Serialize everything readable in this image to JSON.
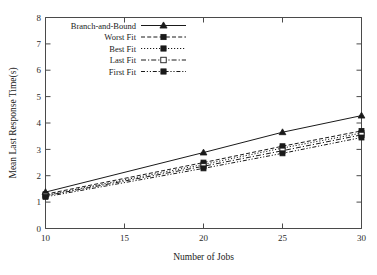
{
  "chart_data": {
    "type": "line",
    "title": "",
    "xlabel": "Number of Jobs",
    "ylabel": "Mean Last Response Time(s)",
    "x": [
      10,
      20,
      25,
      30
    ],
    "xlim": [
      10,
      30
    ],
    "ylim": [
      0,
      8
    ],
    "xticks": [
      "10",
      "15",
      "20",
      "25",
      "30"
    ],
    "xtick_values": [
      10,
      15,
      20,
      25,
      30
    ],
    "yticks": [
      "0",
      "1",
      "2",
      "3",
      "4",
      "5",
      "6",
      "7",
      "8"
    ],
    "ytick_values": [
      0,
      1,
      2,
      3,
      4,
      5,
      6,
      7,
      8
    ],
    "grid": false,
    "legend_position": "top-left-inside",
    "series": [
      {
        "name": "Branch-and-Bound",
        "values": [
          1.38,
          2.88,
          3.65,
          4.28
        ],
        "dash": "none",
        "marker": "filled-triangle"
      },
      {
        "name": "Worst Fit",
        "values": [
          1.3,
          2.5,
          3.12,
          3.7
        ],
        "dash": "dashed",
        "marker": "filled-square"
      },
      {
        "name": "Best Fit",
        "values": [
          1.26,
          2.43,
          3.05,
          3.62
        ],
        "dash": "dotted",
        "marker": "filled-square"
      },
      {
        "name": "Last Fit",
        "values": [
          1.24,
          2.36,
          2.95,
          3.55
        ],
        "dash": "dashdot",
        "marker": "open-square"
      },
      {
        "name": "First Fit",
        "values": [
          1.2,
          2.28,
          2.85,
          3.45
        ],
        "dash": "dashdotdot",
        "marker": "filled-square"
      }
    ]
  },
  "legend": {
    "entries": [
      {
        "label": "Branch-and-Bound"
      },
      {
        "label": "Worst Fit"
      },
      {
        "label": "Best Fit"
      },
      {
        "label": "Last Fit"
      },
      {
        "label": "First Fit"
      }
    ]
  },
  "colors": {
    "line": "#1a1a1a",
    "axis": "#4a4a4a",
    "background": "#ffffff"
  }
}
